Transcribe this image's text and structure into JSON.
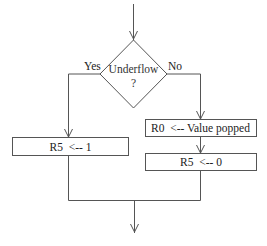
{
  "diagram": {
    "type": "flowchart",
    "decision": {
      "label": "Underflow",
      "sublabel": "?",
      "yes_label": "Yes",
      "no_label": "No"
    },
    "yes_branch": {
      "steps": [
        "R5  <-- 1"
      ]
    },
    "no_branch": {
      "steps": [
        "R0  <-- Value popped",
        "R5  <-- 0"
      ]
    },
    "colors": {
      "line": "#555555",
      "text": "#222222",
      "background": "#ffffff"
    }
  }
}
